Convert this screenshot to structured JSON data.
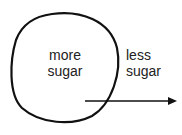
{
  "diagram": {
    "inside_label": {
      "line1": "more",
      "line2": "sugar"
    },
    "outside_label": {
      "line1": "less",
      "line2": "sugar"
    },
    "arrow_direction": "right",
    "colors": {
      "stroke": "#111111",
      "text": "#222222",
      "background": "#ffffff"
    }
  }
}
